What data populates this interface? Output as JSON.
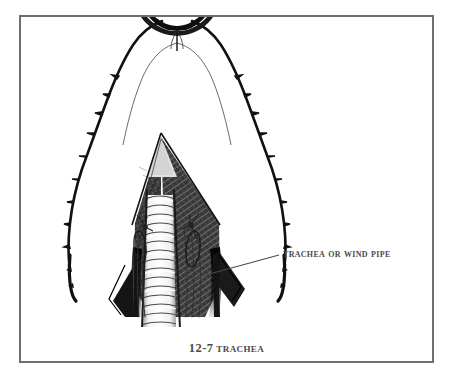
{
  "plate": {
    "title": "Trachea anatomical illustration plate",
    "background_color": "#ffffff",
    "frame_color": "#6e6e70",
    "ink_color": "#101010",
    "text_color": "#4a4a4c"
  },
  "illustration": {
    "subject": "dissected neck showing trachea",
    "description": "Ventral dissection of a fowl's neck with skin reflected to both sides exposing the ringed trachea or wind pipe",
    "style": "engraved line drawing, black ink on white"
  },
  "callout": {
    "label": "Trachea or Wind Pipe",
    "leader_from_x": 190,
    "leader_from_y": 258,
    "leader_to_x": 258,
    "leader_to_y": 238
  },
  "caption": {
    "number": "12-7",
    "title": "Trachea",
    "full": "12-7 Trachea"
  }
}
